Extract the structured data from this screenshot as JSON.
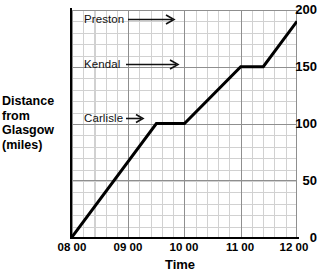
{
  "chart_data": {
    "type": "line",
    "title": "",
    "subtitle": "",
    "xlabel": "Time",
    "ylabel": "Distance from Glasgow (miles)",
    "ylabel_lines": [
      "Distance",
      "from",
      "Glasgow",
      "(miles)"
    ],
    "x_ticklabels": [
      "08 00",
      "09 00",
      "10 00",
      "11 00",
      "12 00"
    ],
    "x_tickvalues": [
      8,
      9,
      10,
      11,
      12
    ],
    "y_ticklabels": [
      "0",
      "50",
      "100",
      "150",
      "200"
    ],
    "y_tickvalues": [
      0,
      50,
      100,
      150,
      200
    ],
    "xlim": [
      8,
      12
    ],
    "ylim": [
      0,
      200
    ],
    "grid": "on",
    "grid_minor_x_step_hours": 0.1333,
    "grid_minor_y_step_miles": 5,
    "grid_major_x_step_hours": 1,
    "grid_major_y_step_miles": 50,
    "legend": "none",
    "series": [
      {
        "name": "Journey",
        "color": "#000000",
        "points": [
          {
            "x": 8.0,
            "y": 0,
            "time": "08 00",
            "distance": 0
          },
          {
            "x": 9.5,
            "y": 100,
            "time": "09 30",
            "distance": 100
          },
          {
            "x": 10.0,
            "y": 100,
            "time": "10 00",
            "distance": 100
          },
          {
            "x": 11.0,
            "y": 150,
            "time": "11 00",
            "distance": 150
          },
          {
            "x": 11.4,
            "y": 150,
            "time": "11 24",
            "distance": 150
          },
          {
            "x": 12.0,
            "y": 190,
            "time": "12 00",
            "distance": 190
          }
        ]
      }
    ],
    "annotations": [
      {
        "label": "Preston",
        "arrow": "right",
        "x": 9.1,
        "y": 185
      },
      {
        "label": "Kendal",
        "arrow": "right",
        "x": 9.1,
        "y": 150
      },
      {
        "label": "Carlisle",
        "arrow": "right",
        "x": 8.9,
        "y": 100
      }
    ]
  },
  "axes": {
    "y_ticks": [
      {
        "label": "200"
      },
      {
        "label": "150"
      },
      {
        "label": "100"
      },
      {
        "label": "50"
      },
      {
        "label": "0"
      }
    ],
    "x_ticks": [
      {
        "label": "08 00"
      },
      {
        "label": "09 00"
      },
      {
        "label": "10 00"
      },
      {
        "label": "11 00"
      },
      {
        "label": "12 00"
      }
    ],
    "y_title_lines": [
      {
        "text": "Distance"
      },
      {
        "text": "from"
      },
      {
        "text": "Glasgow"
      },
      {
        "text": "(miles)"
      }
    ],
    "x_title": "Time"
  },
  "annotations": [
    {
      "label": "Preston"
    },
    {
      "label": "Kendal"
    },
    {
      "label": "Carlisle"
    }
  ],
  "colors": {
    "line": "#000000",
    "grid_minor": "#c9c9c9",
    "grid_major": "#8f8f8f",
    "axis": "#000000",
    "text": "#000000",
    "background": "#ffffff"
  }
}
